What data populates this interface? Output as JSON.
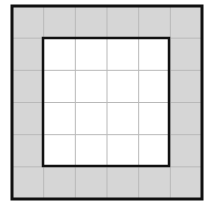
{
  "diagram": {
    "type": "grid-border-figure",
    "grid": {
      "rows": 6,
      "cols": 6
    },
    "outer_square": {
      "cells": 6,
      "x": 12,
      "y": 6,
      "width": 190,
      "height": 193
    },
    "inner_square": {
      "cells": 4,
      "x": 43,
      "y": 38,
      "width": 126,
      "height": 128
    },
    "shaded_region": "outer ring of 20 cells",
    "unshaded_region": "inner 4x4 block of 16 cells",
    "colors": {
      "shade": "#d6d6d6",
      "inner_fill": "#ffffff",
      "grid_line": "#b9b9b9",
      "border": "#111111"
    }
  }
}
